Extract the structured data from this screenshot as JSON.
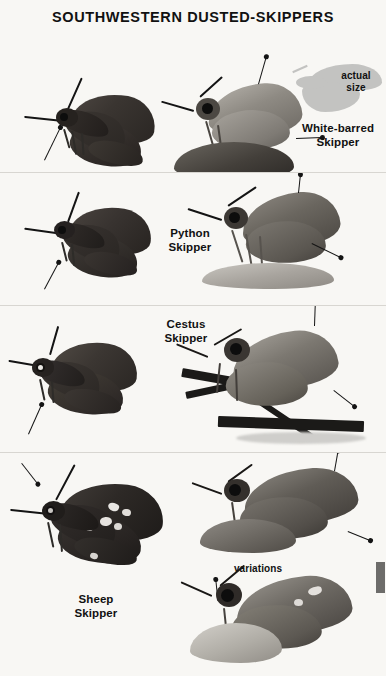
{
  "plate": {
    "title": "SOUTHWESTERN DUSTED-SKIPPERS",
    "background_color": "#f8f7f4",
    "divider_color": "#d8d6d1",
    "text_color": "#111111"
  },
  "annotations": {
    "actual_size": "actual\nsize",
    "variations": "variations"
  },
  "panels": [
    {
      "id": "panel-white-barred",
      "species_label": "White-barred\nSkipper",
      "specimens": [
        {
          "name": "dorsal-spread-specimen",
          "view": "dorsal"
        },
        {
          "name": "lateral-perched-specimen",
          "view": "lateral"
        }
      ],
      "has_actual_size_silhouette": true
    },
    {
      "id": "panel-python",
      "species_label": "Python\nSkipper",
      "specimens": [
        {
          "name": "dorsal-spread-specimen",
          "view": "dorsal"
        },
        {
          "name": "lateral-perched-specimen",
          "view": "lateral"
        }
      ],
      "has_actual_size_silhouette": false
    },
    {
      "id": "panel-cestus",
      "species_label": "Cestus\nSkipper",
      "specimens": [
        {
          "name": "dorsal-spread-specimen",
          "view": "dorsal"
        },
        {
          "name": "lateral-on-grass-specimen",
          "view": "lateral"
        }
      ],
      "has_actual_size_silhouette": false
    },
    {
      "id": "panel-sheep",
      "species_label": "Sheep\nSkipper",
      "specimens": [
        {
          "name": "dorsal-spread-specimen",
          "view": "dorsal"
        },
        {
          "name": "lateral-perched-specimen",
          "view": "lateral"
        },
        {
          "name": "lateral-variation-specimen",
          "view": "lateral"
        }
      ],
      "has_actual_size_silhouette": false
    }
  ],
  "edge_tab": {
    "color": "#6d6c6a"
  }
}
